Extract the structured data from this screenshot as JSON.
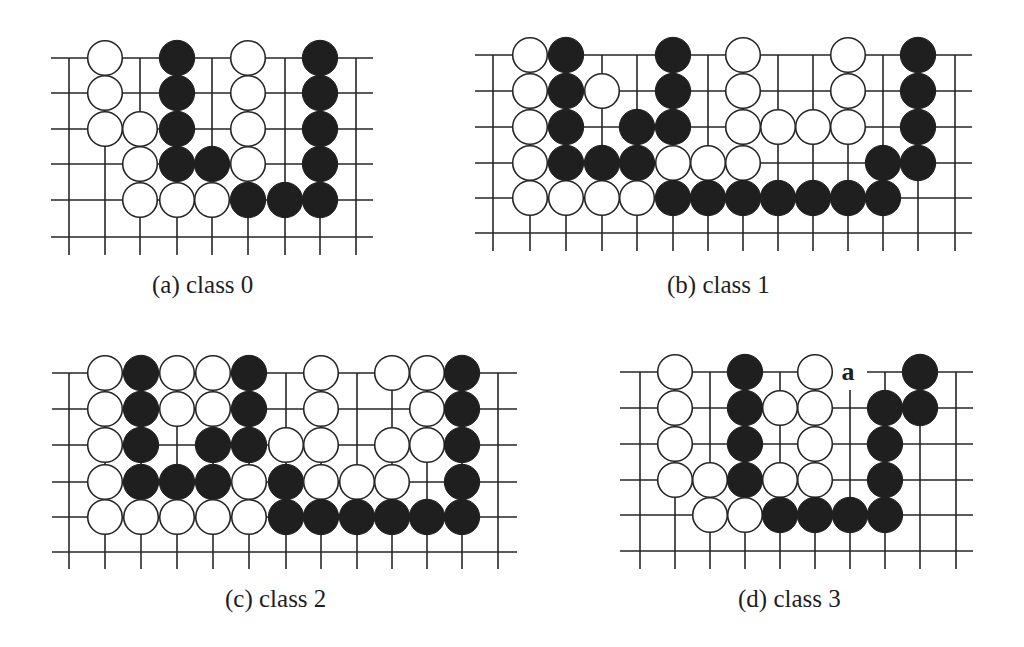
{
  "figure": {
    "colors": {
      "line": "#262626",
      "black_stone": "#1f1f1f",
      "white_stone": "#ffffff",
      "background": "#ffffff"
    },
    "panels": [
      {
        "id": "a",
        "caption": "(a) class 0",
        "caption_pos": {
          "x": 152,
          "y": 272
        },
        "grid": {
          "x": [
            69,
            105,
            140,
            177,
            212,
            248,
            285,
            320,
            356
          ],
          "y": [
            58,
            93,
            129,
            164,
            200,
            237
          ],
          "h_from": 51,
          "h_to": 373,
          "v_bottom": 255
        },
        "stones": [
          {
            "c": 1,
            "r": 0,
            "color": "W"
          },
          {
            "c": 3,
            "r": 0,
            "color": "B"
          },
          {
            "c": 5,
            "r": 0,
            "color": "W"
          },
          {
            "c": 7,
            "r": 0,
            "color": "B"
          },
          {
            "c": 1,
            "r": 1,
            "color": "W"
          },
          {
            "c": 3,
            "r": 1,
            "color": "B"
          },
          {
            "c": 5,
            "r": 1,
            "color": "W"
          },
          {
            "c": 7,
            "r": 1,
            "color": "B"
          },
          {
            "c": 1,
            "r": 2,
            "color": "W"
          },
          {
            "c": 2,
            "r": 2,
            "color": "W"
          },
          {
            "c": 3,
            "r": 2,
            "color": "B"
          },
          {
            "c": 5,
            "r": 2,
            "color": "W"
          },
          {
            "c": 7,
            "r": 2,
            "color": "B"
          },
          {
            "c": 2,
            "r": 3,
            "color": "W"
          },
          {
            "c": 3,
            "r": 3,
            "color": "B"
          },
          {
            "c": 4,
            "r": 3,
            "color": "B"
          },
          {
            "c": 5,
            "r": 3,
            "color": "W"
          },
          {
            "c": 7,
            "r": 3,
            "color": "B"
          },
          {
            "c": 2,
            "r": 4,
            "color": "W"
          },
          {
            "c": 3,
            "r": 4,
            "color": "W"
          },
          {
            "c": 4,
            "r": 4,
            "color": "W"
          },
          {
            "c": 5,
            "r": 4,
            "color": "B"
          },
          {
            "c": 6,
            "r": 4,
            "color": "B"
          },
          {
            "c": 7,
            "r": 4,
            "color": "B"
          }
        ],
        "labels": []
      },
      {
        "id": "b",
        "caption": "(b) class 1",
        "caption_pos": {
          "x": 667,
          "y": 272
        },
        "grid": {
          "x": [
            493,
            530,
            566,
            602,
            637,
            673,
            708,
            743,
            778,
            813,
            848,
            883,
            918,
            955
          ],
          "y": [
            55,
            91,
            127,
            163,
            198,
            233
          ],
          "h_from": 475,
          "h_to": 972,
          "v_bottom": 251
        },
        "stones": [
          {
            "c": 1,
            "r": 0,
            "color": "W"
          },
          {
            "c": 2,
            "r": 0,
            "color": "B"
          },
          {
            "c": 5,
            "r": 0,
            "color": "B"
          },
          {
            "c": 7,
            "r": 0,
            "color": "W"
          },
          {
            "c": 10,
            "r": 0,
            "color": "W"
          },
          {
            "c": 12,
            "r": 0,
            "color": "B"
          },
          {
            "c": 1,
            "r": 1,
            "color": "W"
          },
          {
            "c": 2,
            "r": 1,
            "color": "B"
          },
          {
            "c": 3,
            "r": 1,
            "color": "W"
          },
          {
            "c": 5,
            "r": 1,
            "color": "B"
          },
          {
            "c": 7,
            "r": 1,
            "color": "W"
          },
          {
            "c": 10,
            "r": 1,
            "color": "W"
          },
          {
            "c": 12,
            "r": 1,
            "color": "B"
          },
          {
            "c": 1,
            "r": 2,
            "color": "W"
          },
          {
            "c": 2,
            "r": 2,
            "color": "B"
          },
          {
            "c": 4,
            "r": 2,
            "color": "B"
          },
          {
            "c": 5,
            "r": 2,
            "color": "B"
          },
          {
            "c": 7,
            "r": 2,
            "color": "W"
          },
          {
            "c": 8,
            "r": 2,
            "color": "W"
          },
          {
            "c": 9,
            "r": 2,
            "color": "W"
          },
          {
            "c": 10,
            "r": 2,
            "color": "W"
          },
          {
            "c": 12,
            "r": 2,
            "color": "B"
          },
          {
            "c": 1,
            "r": 3,
            "color": "W"
          },
          {
            "c": 2,
            "r": 3,
            "color": "B"
          },
          {
            "c": 3,
            "r": 3,
            "color": "B"
          },
          {
            "c": 4,
            "r": 3,
            "color": "B"
          },
          {
            "c": 5,
            "r": 3,
            "color": "W"
          },
          {
            "c": 6,
            "r": 3,
            "color": "W"
          },
          {
            "c": 7,
            "r": 3,
            "color": "W"
          },
          {
            "c": 11,
            "r": 3,
            "color": "B"
          },
          {
            "c": 12,
            "r": 3,
            "color": "B"
          },
          {
            "c": 1,
            "r": 4,
            "color": "W"
          },
          {
            "c": 2,
            "r": 4,
            "color": "W"
          },
          {
            "c": 3,
            "r": 4,
            "color": "W"
          },
          {
            "c": 4,
            "r": 4,
            "color": "W"
          },
          {
            "c": 5,
            "r": 4,
            "color": "B"
          },
          {
            "c": 6,
            "r": 4,
            "color": "B"
          },
          {
            "c": 7,
            "r": 4,
            "color": "B"
          },
          {
            "c": 8,
            "r": 4,
            "color": "B"
          },
          {
            "c": 9,
            "r": 4,
            "color": "B"
          },
          {
            "c": 10,
            "r": 4,
            "color": "B"
          },
          {
            "c": 11,
            "r": 4,
            "color": "B"
          }
        ],
        "labels": []
      },
      {
        "id": "c",
        "caption": "(c) class 2",
        "caption_pos": {
          "x": 225,
          "y": 586
        },
        "grid": {
          "x": [
            69,
            105,
            141,
            177,
            213,
            249,
            286,
            321,
            357,
            392,
            427,
            462,
            498
          ],
          "y": [
            373,
            409,
            445,
            482,
            517,
            552
          ],
          "h_from": 52,
          "h_to": 517,
          "v_bottom": 569
        },
        "stones": [
          {
            "c": 1,
            "r": 0,
            "color": "W"
          },
          {
            "c": 2,
            "r": 0,
            "color": "B"
          },
          {
            "c": 3,
            "r": 0,
            "color": "W"
          },
          {
            "c": 4,
            "r": 0,
            "color": "W"
          },
          {
            "c": 5,
            "r": 0,
            "color": "B"
          },
          {
            "c": 7,
            "r": 0,
            "color": "W"
          },
          {
            "c": 9,
            "r": 0,
            "color": "W"
          },
          {
            "c": 10,
            "r": 0,
            "color": "W"
          },
          {
            "c": 11,
            "r": 0,
            "color": "B"
          },
          {
            "c": 1,
            "r": 1,
            "color": "W"
          },
          {
            "c": 2,
            "r": 1,
            "color": "B"
          },
          {
            "c": 3,
            "r": 1,
            "color": "W"
          },
          {
            "c": 4,
            "r": 1,
            "color": "W"
          },
          {
            "c": 5,
            "r": 1,
            "color": "B"
          },
          {
            "c": 7,
            "r": 1,
            "color": "W"
          },
          {
            "c": 10,
            "r": 1,
            "color": "W"
          },
          {
            "c": 11,
            "r": 1,
            "color": "B"
          },
          {
            "c": 1,
            "r": 2,
            "color": "W"
          },
          {
            "c": 2,
            "r": 2,
            "color": "B"
          },
          {
            "c": 4,
            "r": 2,
            "color": "B"
          },
          {
            "c": 5,
            "r": 2,
            "color": "B"
          },
          {
            "c": 6,
            "r": 2,
            "color": "W"
          },
          {
            "c": 7,
            "r": 2,
            "color": "W"
          },
          {
            "c": 9,
            "r": 2,
            "color": "W"
          },
          {
            "c": 10,
            "r": 2,
            "color": "W"
          },
          {
            "c": 11,
            "r": 2,
            "color": "B"
          },
          {
            "c": 1,
            "r": 3,
            "color": "W"
          },
          {
            "c": 2,
            "r": 3,
            "color": "B"
          },
          {
            "c": 3,
            "r": 3,
            "color": "B"
          },
          {
            "c": 4,
            "r": 3,
            "color": "B"
          },
          {
            "c": 5,
            "r": 3,
            "color": "W"
          },
          {
            "c": 6,
            "r": 3,
            "color": "B"
          },
          {
            "c": 7,
            "r": 3,
            "color": "W"
          },
          {
            "c": 8,
            "r": 3,
            "color": "W"
          },
          {
            "c": 9,
            "r": 3,
            "color": "W"
          },
          {
            "c": 11,
            "r": 3,
            "color": "B"
          },
          {
            "c": 1,
            "r": 4,
            "color": "W"
          },
          {
            "c": 2,
            "r": 4,
            "color": "W"
          },
          {
            "c": 3,
            "r": 4,
            "color": "W"
          },
          {
            "c": 4,
            "r": 4,
            "color": "W"
          },
          {
            "c": 5,
            "r": 4,
            "color": "W"
          },
          {
            "c": 6,
            "r": 4,
            "color": "B"
          },
          {
            "c": 7,
            "r": 4,
            "color": "B"
          },
          {
            "c": 8,
            "r": 4,
            "color": "B"
          },
          {
            "c": 9,
            "r": 4,
            "color": "B"
          },
          {
            "c": 10,
            "r": 4,
            "color": "B"
          },
          {
            "c": 11,
            "r": 4,
            "color": "B"
          }
        ],
        "labels": []
      },
      {
        "id": "d",
        "caption": "(d) class 3",
        "caption_pos": {
          "x": 738,
          "y": 586
        },
        "grid": {
          "x": [
            640,
            675,
            710,
            745,
            780,
            815,
            850,
            885,
            920,
            956
          ],
          "y": [
            372,
            408,
            444,
            480,
            515,
            551
          ],
          "h_from": 620,
          "h_to": 973,
          "v_bottom": 569
        },
        "stones": [
          {
            "c": 1,
            "r": 0,
            "color": "W"
          },
          {
            "c": 3,
            "r": 0,
            "color": "B"
          },
          {
            "c": 5,
            "r": 0,
            "color": "W"
          },
          {
            "c": 8,
            "r": 0,
            "color": "B"
          },
          {
            "c": 1,
            "r": 1,
            "color": "W"
          },
          {
            "c": 3,
            "r": 1,
            "color": "B"
          },
          {
            "c": 4,
            "r": 1,
            "color": "W"
          },
          {
            "c": 5,
            "r": 1,
            "color": "W"
          },
          {
            "c": 7,
            "r": 1,
            "color": "B"
          },
          {
            "c": 8,
            "r": 1,
            "color": "B"
          },
          {
            "c": 1,
            "r": 2,
            "color": "W"
          },
          {
            "c": 3,
            "r": 2,
            "color": "B"
          },
          {
            "c": 5,
            "r": 2,
            "color": "W"
          },
          {
            "c": 7,
            "r": 2,
            "color": "B"
          },
          {
            "c": 1,
            "r": 3,
            "color": "W"
          },
          {
            "c": 2,
            "r": 3,
            "color": "W"
          },
          {
            "c": 3,
            "r": 3,
            "color": "B"
          },
          {
            "c": 4,
            "r": 3,
            "color": "W"
          },
          {
            "c": 5,
            "r": 3,
            "color": "W"
          },
          {
            "c": 7,
            "r": 3,
            "color": "B"
          },
          {
            "c": 2,
            "r": 4,
            "color": "W"
          },
          {
            "c": 3,
            "r": 4,
            "color": "W"
          },
          {
            "c": 4,
            "r": 4,
            "color": "B"
          },
          {
            "c": 5,
            "r": 4,
            "color": "B"
          },
          {
            "c": 6,
            "r": 4,
            "color": "B"
          },
          {
            "c": 7,
            "r": 4,
            "color": "B"
          }
        ],
        "labels": [
          {
            "c": 6,
            "r": 0,
            "text": "a",
            "gap_from": 832,
            "gap_to": 867,
            "v_start": 390
          }
        ]
      }
    ],
    "stone_radius": 17.3
  }
}
